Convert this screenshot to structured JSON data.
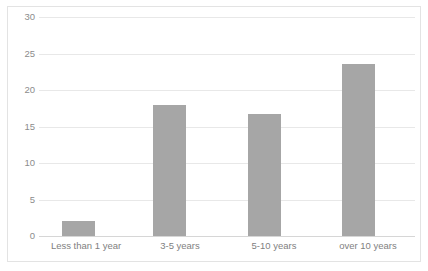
{
  "chart_data": {
    "type": "bar",
    "title": "",
    "xlabel": "",
    "ylabel": "",
    "categories": [
      "Less than 1 year",
      "3-5 years",
      "5-10 years",
      "over 10 years"
    ],
    "values": [
      2.0,
      17.9,
      16.7,
      23.5
    ],
    "ylim": [
      0,
      30
    ],
    "ytick_labels": [
      "0",
      "5",
      "10",
      "15",
      "20",
      "25",
      "30"
    ],
    "ytick_values": [
      0,
      5,
      10,
      15,
      20,
      25,
      30
    ],
    "grid": true,
    "legend": false,
    "legend_position": "none",
    "series": [
      {
        "name": "",
        "values": [
          2.0,
          17.9,
          16.7,
          23.5
        ]
      }
    ],
    "colors": {
      "bar_fill": "#a6a6a6",
      "gridline": "#e8e8e8",
      "axis_line": "#d6d6d6",
      "tick_text": "#7f7f7f",
      "frame_border": "#e3e3e3",
      "background": "#ffffff"
    }
  }
}
